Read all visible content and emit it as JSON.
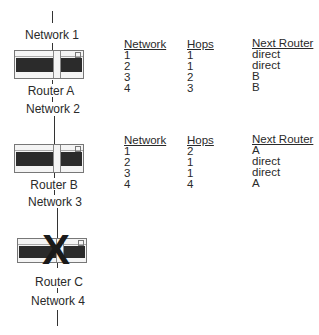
{
  "diagram": {
    "networks": [
      {
        "label": "Network 1"
      },
      {
        "label": "Network 2"
      },
      {
        "label": "Network 3"
      },
      {
        "label": "Network 4"
      }
    ],
    "routers": [
      {
        "label": "Router A",
        "failed": false
      },
      {
        "label": "Router B",
        "failed": false
      },
      {
        "label": "Router C",
        "failed": true,
        "failure_mark": "X"
      }
    ]
  },
  "tables": [
    {
      "headers": {
        "network": "Network",
        "hops": "Hops",
        "next": "Next Router"
      },
      "rows": [
        {
          "network": "1",
          "hops": "1",
          "next": "direct"
        },
        {
          "network": "2",
          "hops": "1",
          "next": "direct"
        },
        {
          "network": "3",
          "hops": "2",
          "next": "B"
        },
        {
          "network": "4",
          "hops": "3",
          "next": "B"
        }
      ]
    },
    {
      "headers": {
        "network": "Network",
        "hops": "Hops",
        "next": "Next Router"
      },
      "rows": [
        {
          "network": "1",
          "hops": "2",
          "next": "A"
        },
        {
          "network": "2",
          "hops": "1",
          "next": "direct"
        },
        {
          "network": "3",
          "hops": "1",
          "next": "direct"
        },
        {
          "network": "4",
          "hops": "4",
          "next": "A"
        }
      ]
    }
  ]
}
